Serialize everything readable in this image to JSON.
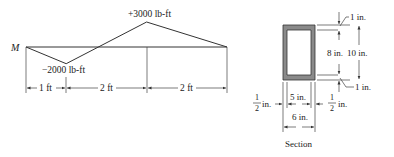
{
  "moment_diagram": {
    "axis_label": "M",
    "max_label": "+3000 lb-ft",
    "min_label": "−2000 lb-ft",
    "max_value_lbft": 3000,
    "min_value_lbft": -2000,
    "points": [
      {
        "x_ft": 0,
        "M_lbft": 0
      },
      {
        "x_ft": 1,
        "M_lbft": -2000
      },
      {
        "x_ft": 3,
        "M_lbft": 3000
      },
      {
        "x_ft": 5,
        "M_lbft": 0
      }
    ],
    "spans": [
      {
        "label": "1 ft",
        "length_ft": 1
      },
      {
        "label": "2 ft",
        "length_ft": 2
      },
      {
        "label": "2 ft",
        "length_ft": 2
      }
    ]
  },
  "section": {
    "caption": "Section",
    "outer_height_label": "10 in.",
    "inner_height_label": "8 in.",
    "top_flange_label": "1 in.",
    "bottom_flange_label": "1 in.",
    "inner_width_label": "5 in.",
    "outer_width_label": "6 in.",
    "left_web_label_num": "1",
    "left_web_label_den": "2",
    "left_web_unit": "in.",
    "right_web_label_num": "1",
    "right_web_label_den": "2",
    "right_web_unit": "in.",
    "fill_color": "#8a8a8a"
  }
}
